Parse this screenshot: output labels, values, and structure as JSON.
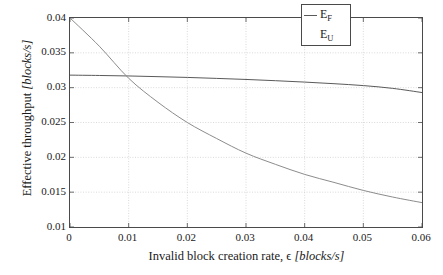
{
  "chart_data": {
    "type": "line",
    "title": "",
    "xlabel": "Invalid block creation rate, ϵ [blocks/s]",
    "xlabel_plain": "Invalid block creation rate,",
    "xlabel_symbol": "ϵ",
    "xlabel_units": "[blocks/s]",
    "ylabel": "Effective throughput [blocks/s]",
    "ylabel_plain": "Effective throughput",
    "ylabel_units": "[blocks/s]",
    "xlim": [
      0,
      0.06
    ],
    "ylim": [
      0.01,
      0.04
    ],
    "xticks": [
      0,
      0.01,
      0.02,
      0.03,
      0.04,
      0.05,
      0.06
    ],
    "xtick_labels": [
      "0",
      "0.01",
      "0.02",
      "0.03",
      "0.04",
      "0.05",
      "0.06"
    ],
    "yticks": [
      0.01,
      0.015,
      0.02,
      0.025,
      0.03,
      0.035,
      0.04
    ],
    "ytick_labels": [
      "0.01",
      "0.015",
      "0.02",
      "0.025",
      "0.03",
      "0.035",
      "0.04"
    ],
    "grid": true,
    "grid_color": "#c8c8c8",
    "axis_color": "#4a4a4a",
    "legend_position": "top-right",
    "series": [
      {
        "name": "E_F",
        "label_base": "E",
        "label_sub": "F",
        "color": "#5a5a5a",
        "x": [
          0,
          0.005,
          0.01,
          0.015,
          0.02,
          0.025,
          0.03,
          0.035,
          0.04,
          0.045,
          0.05,
          0.055,
          0.06
        ],
        "values": [
          0.0318,
          0.03175,
          0.03168,
          0.03158,
          0.03147,
          0.03133,
          0.03118,
          0.031,
          0.0308,
          0.03057,
          0.0303,
          0.0299,
          0.0293
        ]
      },
      {
        "name": "E_U",
        "label_base": "E",
        "label_sub": "U",
        "color": "#8c8c8c",
        "x": [
          0,
          0.005,
          0.01,
          0.015,
          0.02,
          0.025,
          0.03,
          0.035,
          0.04,
          0.045,
          0.05,
          0.055,
          0.06
        ],
        "values": [
          0.04,
          0.03595,
          0.03135,
          0.0279,
          0.025,
          0.0227,
          0.0206,
          0.019,
          0.01755,
          0.0164,
          0.01525,
          0.0143,
          0.0135
        ]
      }
    ],
    "annotations": [
      {
        "text": "curves cross",
        "x": 0.009,
        "y": 0.0317
      }
    ]
  },
  "legend": {
    "entries": [
      {
        "base": "E",
        "sub": "F"
      },
      {
        "base": "E",
        "sub": "U"
      }
    ]
  }
}
